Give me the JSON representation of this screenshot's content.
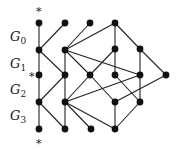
{
  "diagram": {
    "type": "layered-graph",
    "background": "#ffffff",
    "node_color": "#111111",
    "edge_color": "#222222",
    "labels": [
      {
        "id": "G0",
        "base": "G",
        "sub": "0",
        "x": 10,
        "y": 41
      },
      {
        "id": "G1",
        "base": "G",
        "sub": "1",
        "x": 10,
        "y": 68
      },
      {
        "id": "G2",
        "base": "G",
        "sub": "2",
        "x": 10,
        "y": 94
      },
      {
        "id": "G3",
        "base": "G",
        "sub": "3",
        "x": 10,
        "y": 120
      }
    ],
    "stars": [
      {
        "text": "*",
        "x": 36,
        "y": 15
      },
      {
        "text": "*",
        "x": 29,
        "y": 80
      },
      {
        "text": "*",
        "x": 36,
        "y": 147
      }
    ],
    "nodes": [
      {
        "id": "a1",
        "x": 39,
        "y": 23
      },
      {
        "id": "a2",
        "x": 65,
        "y": 23
      },
      {
        "id": "a3",
        "x": 90,
        "y": 23
      },
      {
        "id": "a4",
        "x": 115,
        "y": 23
      },
      {
        "id": "b1",
        "x": 39,
        "y": 50
      },
      {
        "id": "b2",
        "x": 65,
        "y": 50
      },
      {
        "id": "b3",
        "x": 115,
        "y": 49
      },
      {
        "id": "b4",
        "x": 140,
        "y": 49
      },
      {
        "id": "c1",
        "x": 39,
        "y": 75
      },
      {
        "id": "c2",
        "x": 65,
        "y": 75
      },
      {
        "id": "c3",
        "x": 90,
        "y": 75
      },
      {
        "id": "c4",
        "x": 115,
        "y": 75
      },
      {
        "id": "c5",
        "x": 140,
        "y": 75
      },
      {
        "id": "c6",
        "x": 166,
        "y": 75
      },
      {
        "id": "d1",
        "x": 39,
        "y": 102
      },
      {
        "id": "d2",
        "x": 65,
        "y": 102
      },
      {
        "id": "d3",
        "x": 115,
        "y": 102
      },
      {
        "id": "d4",
        "x": 140,
        "y": 102
      },
      {
        "id": "e1",
        "x": 39,
        "y": 129
      },
      {
        "id": "e2",
        "x": 65,
        "y": 129
      },
      {
        "id": "e3",
        "x": 91,
        "y": 129
      },
      {
        "id": "e4",
        "x": 115,
        "y": 129
      }
    ],
    "edges": [
      [
        "a1",
        "b1"
      ],
      [
        "a2",
        "b1"
      ],
      [
        "a3",
        "b2"
      ],
      [
        "a4",
        "b2"
      ],
      [
        "a4",
        "b3"
      ],
      [
        "a4",
        "b4"
      ],
      [
        "b1",
        "c1"
      ],
      [
        "b1",
        "c2"
      ],
      [
        "b2",
        "c2"
      ],
      [
        "b2",
        "c3"
      ],
      [
        "b2",
        "c5"
      ],
      [
        "b3",
        "c3"
      ],
      [
        "b3",
        "c4"
      ],
      [
        "b4",
        "c5"
      ],
      [
        "b4",
        "c6"
      ],
      [
        "c1",
        "d1"
      ],
      [
        "c2",
        "d1"
      ],
      [
        "c2",
        "d2"
      ],
      [
        "c3",
        "d2"
      ],
      [
        "c3",
        "d3"
      ],
      [
        "c5",
        "d2"
      ],
      [
        "c4",
        "d4"
      ],
      [
        "c6",
        "d3"
      ],
      [
        "c5",
        "d4"
      ],
      [
        "d1",
        "e1"
      ],
      [
        "d1",
        "e2"
      ],
      [
        "d2",
        "e2"
      ],
      [
        "d2",
        "e3"
      ],
      [
        "d2",
        "e4"
      ],
      [
        "d3",
        "e4"
      ],
      [
        "d4",
        "e4"
      ]
    ]
  }
}
